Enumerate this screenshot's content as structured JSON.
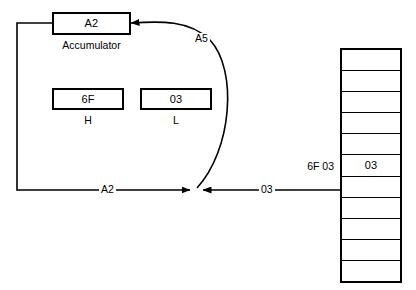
{
  "diagram": {
    "stroke_color": "#000000",
    "background_color": "#ffffff"
  },
  "accumulator": {
    "value": "A2",
    "caption": "Accumulator"
  },
  "registers": [
    {
      "value": "6F",
      "caption": "H"
    },
    {
      "value": "03",
      "caption": "L"
    }
  ],
  "edge_labels": {
    "curve_top": "A5",
    "left_path": "A2",
    "memory_path": "03"
  },
  "memory": {
    "address_label": "6F 03",
    "cells": [
      {
        "value": ""
      },
      {
        "value": ""
      },
      {
        "value": ""
      },
      {
        "value": ""
      },
      {
        "value": ""
      },
      {
        "value": "03"
      },
      {
        "value": ""
      },
      {
        "value": ""
      },
      {
        "value": ""
      },
      {
        "value": ""
      },
      {
        "value": ""
      }
    ]
  }
}
